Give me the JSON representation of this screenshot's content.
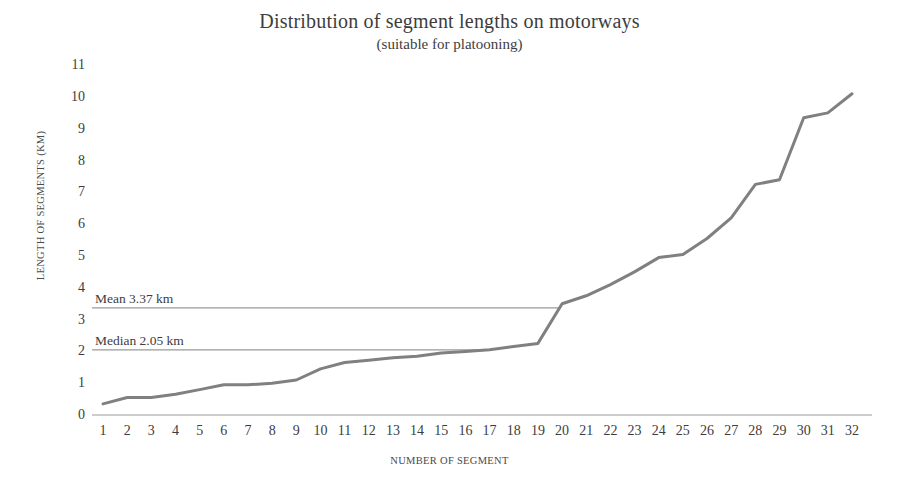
{
  "chart_data": {
    "type": "line",
    "title": "Distribution of segment lengths on motorways",
    "subtitle": "(suitable for platooning)",
    "xlabel": "NUMBER OF SEGMENT",
    "ylabel": "LENGTH OF SEGMENTS (KM)",
    "xlim": [
      1,
      32
    ],
    "ylim": [
      0,
      11
    ],
    "grid": false,
    "legend": "none",
    "line_color": "#808080",
    "annotation_color": "#8a8a8a",
    "x": [
      1,
      2,
      3,
      4,
      5,
      6,
      7,
      8,
      9,
      10,
      11,
      12,
      13,
      14,
      15,
      16,
      17,
      18,
      19,
      20,
      21,
      22,
      23,
      24,
      25,
      26,
      27,
      28,
      29,
      30,
      31,
      32
    ],
    "categories": [
      "1",
      "2",
      "3",
      "4",
      "5",
      "6",
      "7",
      "8",
      "9",
      "10",
      "11",
      "12",
      "13",
      "14",
      "15",
      "16",
      "17",
      "18",
      "19",
      "20",
      "21",
      "22",
      "23",
      "24",
      "25",
      "26",
      "27",
      "28",
      "29",
      "30",
      "31",
      "32"
    ],
    "values": [
      0.35,
      0.55,
      0.55,
      0.65,
      0.8,
      0.95,
      0.95,
      1.0,
      1.1,
      1.45,
      1.65,
      1.72,
      1.8,
      1.85,
      1.95,
      2.0,
      2.05,
      2.15,
      2.25,
      3.5,
      3.75,
      4.1,
      4.5,
      4.95,
      5.05,
      5.55,
      6.2,
      7.25,
      7.4,
      9.35,
      9.5,
      10.1
    ],
    "series": [
      {
        "name": "Length of segments",
        "values": [
          0.35,
          0.55,
          0.55,
          0.65,
          0.8,
          0.95,
          0.95,
          1.0,
          1.1,
          1.45,
          1.65,
          1.72,
          1.8,
          1.85,
          1.95,
          2.0,
          2.05,
          2.15,
          2.25,
          3.5,
          3.75,
          4.1,
          4.5,
          4.95,
          5.05,
          5.55,
          6.2,
          7.25,
          7.4,
          9.35,
          9.5,
          10.1
        ]
      }
    ],
    "yticks": [
      "0",
      "1",
      "2",
      "3",
      "4",
      "5",
      "6",
      "7",
      "8",
      "9",
      "10",
      "11"
    ],
    "xticks": [
      "1",
      "2",
      "3",
      "4",
      "5",
      "6",
      "7",
      "8",
      "9",
      "10",
      "11",
      "12",
      "13",
      "14",
      "15",
      "16",
      "17",
      "18",
      "19",
      "20",
      "21",
      "22",
      "23",
      "24",
      "25",
      "26",
      "27",
      "28",
      "29",
      "30",
      "31",
      "32"
    ],
    "annotations": [
      {
        "id": "mean",
        "label": "Mean 3.37 km",
        "value": 3.37,
        "kind": "horizontal-line"
      },
      {
        "id": "median",
        "label": "Median 2.05 km",
        "value": 2.05,
        "kind": "horizontal-line"
      }
    ]
  }
}
